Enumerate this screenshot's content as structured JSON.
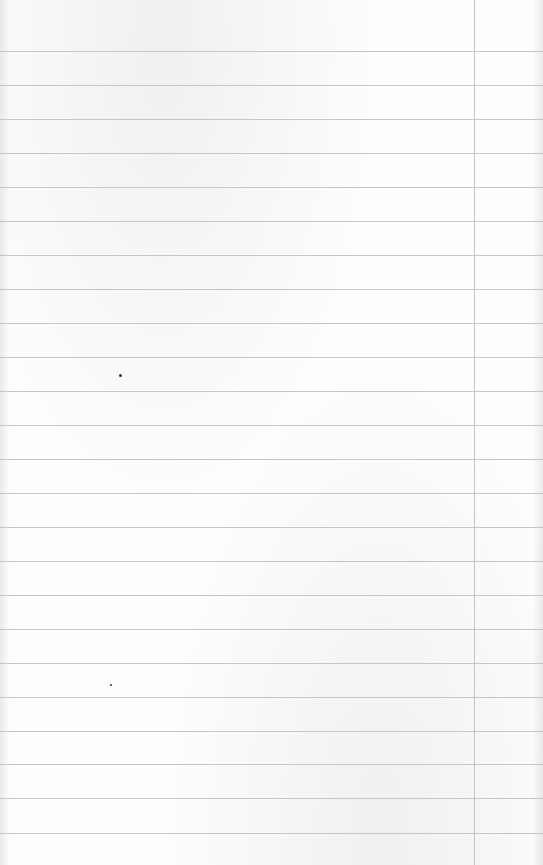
{
  "paper": {
    "background": "#fdfdfd",
    "rule_color": "#bdbdbd",
    "margin_color": "#c4c4c4",
    "rules_y": [
      51,
      85,
      119,
      153,
      187,
      221,
      255,
      289,
      323,
      357,
      391,
      425,
      459,
      493,
      527,
      561,
      595,
      629,
      663,
      697,
      731,
      764,
      798,
      833
    ],
    "margin_x": 474,
    "specks": [
      {
        "x": 119,
        "y": 374,
        "size": 3
      },
      {
        "x": 110,
        "y": 684,
        "size": 2
      }
    ]
  }
}
